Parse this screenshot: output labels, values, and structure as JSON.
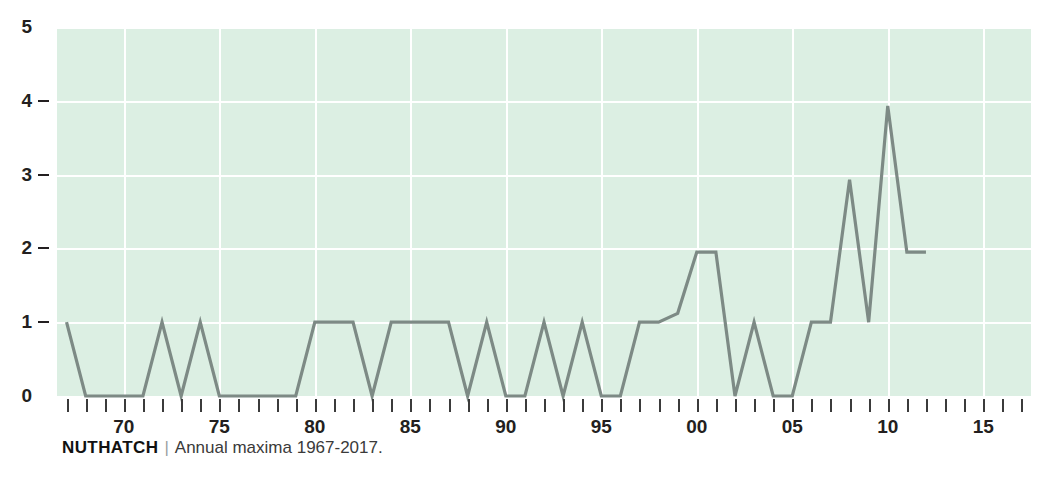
{
  "caption": {
    "name": "NUTHATCH",
    "separator": "|",
    "description": "Annual maxima 1967-2017."
  },
  "chart_data": {
    "type": "line",
    "title": "NUTHATCH",
    "subtitle": "Annual maxima 1967-2017.",
    "xlabel": "",
    "ylabel": "",
    "xlim": [
      1966.5,
      2017.5
    ],
    "ylim": [
      0,
      5
    ],
    "grid": true,
    "legend": null,
    "background_color": "#dcefe3",
    "line_color": "#7d8a85",
    "gridline_color": "#ffffff",
    "text_color": "#231f20",
    "y_ticks": [
      0,
      1,
      2,
      3,
      4,
      5
    ],
    "y_tick_labels": [
      "0",
      "1",
      "2",
      "3",
      "4",
      "5"
    ],
    "x_ticks": [
      1967,
      1968,
      1969,
      1970,
      1971,
      1972,
      1973,
      1974,
      1975,
      1976,
      1977,
      1978,
      1979,
      1980,
      1981,
      1982,
      1983,
      1984,
      1985,
      1986,
      1987,
      1988,
      1989,
      1990,
      1991,
      1992,
      1993,
      1994,
      1995,
      1996,
      1997,
      1998,
      1999,
      2000,
      2001,
      2002,
      2003,
      2004,
      2005,
      2006,
      2007,
      2008,
      2009,
      2010,
      2011,
      2012,
      2013,
      2014,
      2015,
      2016,
      2017
    ],
    "x_labeled_ticks": [
      1970,
      1975,
      1980,
      1985,
      1990,
      1995,
      2000,
      2005,
      2010,
      2015
    ],
    "x_tick_labels": [
      "70",
      "75",
      "80",
      "85",
      "90",
      "95",
      "00",
      "05",
      "10",
      "15"
    ],
    "x": [
      1967,
      1968,
      1969,
      1970,
      1971,
      1972,
      1973,
      1974,
      1975,
      1976,
      1977,
      1978,
      1979,
      1980,
      1981,
      1982,
      1983,
      1984,
      1985,
      1986,
      1987,
      1988,
      1989,
      1990,
      1991,
      1992,
      1993,
      1994,
      1995,
      1996,
      1997,
      1998,
      1999,
      2000,
      2001,
      2002,
      2003,
      2004,
      2005,
      2006,
      2007,
      2008,
      2009,
      2010,
      2011,
      2012,
      2013,
      2014,
      2015,
      2016,
      2017
    ],
    "values": [
      1,
      0,
      0,
      0,
      0,
      1,
      0,
      1,
      0,
      0,
      0,
      0,
      0,
      1,
      1,
      1,
      0,
      1,
      1,
      1,
      1,
      0,
      1,
      0,
      0,
      1,
      0,
      1,
      0,
      0,
      1,
      1,
      1,
      1.95,
      1.95,
      0,
      1,
      0,
      0,
      1,
      1,
      1.12,
      2.93,
      1,
      3.93,
      1.95,
      1.95,
      0,
      0,
      0,
      0
    ],
    "series": [
      {
        "name": "Nuthatch annual maxima",
        "color": "#7d8a85",
        "points": [
          {
            "year": 1967,
            "value": 1
          },
          {
            "year": 1968,
            "value": 0
          },
          {
            "year": 1969,
            "value": 0
          },
          {
            "year": 1970,
            "value": 0
          },
          {
            "year": 1971,
            "value": 0
          },
          {
            "year": 1972,
            "value": 1
          },
          {
            "year": 1973,
            "value": 0
          },
          {
            "year": 1974,
            "value": 1
          },
          {
            "year": 1975,
            "value": 0
          },
          {
            "year": 1976,
            "value": 0
          },
          {
            "year": 1977,
            "value": 0
          },
          {
            "year": 1978,
            "value": 0
          },
          {
            "year": 1979,
            "value": 0
          },
          {
            "year": 1980,
            "value": 1
          },
          {
            "year": 1981,
            "value": 1
          },
          {
            "year": 1982,
            "value": 1
          },
          {
            "year": 1983,
            "value": 0
          },
          {
            "year": 1984,
            "value": 1
          },
          {
            "year": 1985,
            "value": 1
          },
          {
            "year": 1986,
            "value": 1
          },
          {
            "year": 1987,
            "value": 1
          },
          {
            "year": 1988,
            "value": 0
          },
          {
            "year": 1989,
            "value": 1
          },
          {
            "year": 1990,
            "value": 0
          },
          {
            "year": 1991,
            "value": 0
          },
          {
            "year": 1992,
            "value": 1
          },
          {
            "year": 1993,
            "value": 0
          },
          {
            "year": 1994,
            "value": 1
          },
          {
            "year": 1995,
            "value": 0
          },
          {
            "year": 1996,
            "value": 0
          },
          {
            "year": 1997,
            "value": 1
          },
          {
            "year": 1998,
            "value": 1
          },
          {
            "year": 1999,
            "value": 1.12
          },
          {
            "year": 2000,
            "value": 1.95
          },
          {
            "year": 2001,
            "value": 1.95
          },
          {
            "year": 2002,
            "value": 0
          },
          {
            "year": 2003,
            "value": 1
          },
          {
            "year": 2004,
            "value": 0
          },
          {
            "year": 2005,
            "value": 0
          },
          {
            "year": 2006,
            "value": 1
          },
          {
            "year": 2007,
            "value": 1
          },
          {
            "year": 2008,
            "value": 2.93
          },
          {
            "year": 2009,
            "value": 1
          },
          {
            "year": 2010,
            "value": 3.93
          },
          {
            "year": 2011,
            "value": 1.95
          },
          {
            "year": 2012,
            "value": 1.95
          }
        ]
      }
    ]
  }
}
